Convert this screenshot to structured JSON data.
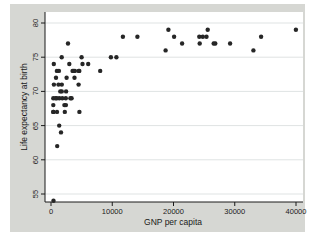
{
  "chart_data": {
    "type": "scatter",
    "title": "",
    "xlabel": "GNP per capita",
    "ylabel": "Life expectancy at birth",
    "xlim": [
      0,
      40000
    ],
    "ylim": [
      54,
      80
    ],
    "x_ticks": [
      0,
      10000,
      20000,
      30000,
      40000
    ],
    "x_tick_labels": [
      "0",
      "10000",
      "20000",
      "30000",
      "40000"
    ],
    "y_ticks": [
      55,
      60,
      65,
      70,
      75,
      80
    ],
    "y_tick_labels": [
      "55",
      "60",
      "65",
      "70",
      "75",
      "80"
    ],
    "grid": "horizontal-only",
    "legend": "none",
    "marker": "filled-circle",
    "points": [
      [
        810,
        72
      ],
      [
        460,
        74
      ],
      [
        26830,
        77
      ],
      [
        480,
        71
      ],
      [
        2180,
        68
      ],
      [
        25380,
        78
      ],
      [
        1220,
        71
      ],
      [
        4620,
        73
      ],
      [
        5150,
        74
      ],
      [
        33040,
        76
      ],
      [
        3360,
        69
      ],
      [
        24280,
        77
      ],
      [
        24210,
        78
      ],
      [
        970,
        73
      ],
      [
        26570,
        77
      ],
      [
        11740,
        78
      ],
      [
        4510,
        71
      ],
      [
        18710,
        76
      ],
      [
        20090,
        78
      ],
      [
        1340,
        65
      ],
      [
        380,
        67
      ],
      [
        2420,
        69
      ],
      [
        2540,
        72
      ],
      [
        1290,
        73
      ],
      [
        380,
        67
      ],
      [
        24780,
        78
      ],
      [
        34310,
        78
      ],
      [
        3910,
        73
      ],
      [
        10670,
        75
      ],
      [
        1360,
        69
      ],
      [
        2260,
        67
      ],
      [
        3700,
        73
      ],
      [
        9780,
        75
      ],
      [
        14100,
        78
      ],
      [
        25580,
        79
      ],
      [
        39980,
        79
      ],
      [
        370,
        69
      ],
      [
        3160,
        69
      ],
      [
        980,
        67
      ],
      [
        21410,
        77
      ],
      [
        950,
        69
      ],
      [
        19170,
        79
      ],
      [
        1770,
        71
      ],
      [
        1850,
        69
      ],
      [
        1640,
        64
      ],
      [
        410,
        54
      ],
      [
        740,
        69
      ],
      [
        1740,
        75
      ],
      [
        3840,
        72
      ],
      [
        370,
        68
      ],
      [
        2990,
        74
      ],
      [
        1760,
        70
      ],
      [
        2440,
        68
      ],
      [
        4520,
        73
      ],
      [
        29240,
        77
      ],
      [
        3530,
        73
      ],
      [
        8030,
        73
      ],
      [
        1010,
        62
      ],
      [
        4630,
        67
      ],
      [
        4990,
        75
      ],
      [
        2470,
        70
      ],
      [
        2770,
        77
      ],
      [
        1520,
        70
      ],
      [
        6070,
        74
      ]
    ]
  },
  "colors": {
    "page_bg": "#ffffff",
    "figure_bg": "#d6d7d3",
    "plot_bg": "#ffffff",
    "grid": "#dfe3e3",
    "axis": "#1a1a1a",
    "marker": "#262626",
    "text": "#1a1a1a"
  }
}
